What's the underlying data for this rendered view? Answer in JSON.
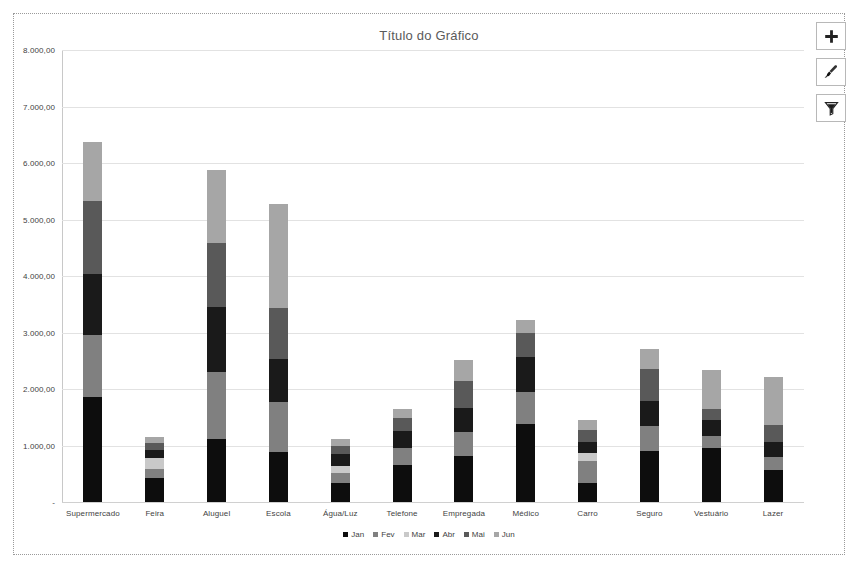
{
  "chart": {
    "title": "Título do Gráfico"
  },
  "buttons": [
    {
      "name": "chart-elements-button",
      "icon": "plus-icon",
      "tooltip": "Elementos do Gráfico"
    },
    {
      "name": "chart-styles-button",
      "icon": "paintbrush-icon",
      "tooltip": "Estilos de Gráfico"
    },
    {
      "name": "chart-filters-button",
      "icon": "funnel-icon",
      "tooltip": "Filtros de Gráfico"
    }
  ],
  "colors": {
    "jan": "#0d0d0d",
    "fev": "#808080",
    "mar": "#c9c9c9",
    "abr": "#1a1a1a",
    "mai": "#595959",
    "jun": "#a6a6a6",
    "gridline": "#e2e2e2",
    "axis": "#c8c8c8",
    "title": "#5a5a5a",
    "text": "#3f3f3f"
  },
  "chart_data": {
    "type": "bar",
    "stacked": true,
    "title": "Título do Gráfico",
    "xlabel": "",
    "ylabel": "",
    "ylim": [
      0,
      8000
    ],
    "grid": true,
    "legend_position": "bottom",
    "ytick_labels": [
      "-",
      "1.000,00",
      "2.000,00",
      "3.000,00",
      "4.000,00",
      "5.000,00",
      "6.000,00",
      "7.000,00",
      "8.000,00"
    ],
    "ytick_values": [
      0,
      1000,
      2000,
      3000,
      4000,
      5000,
      6000,
      7000,
      8000
    ],
    "categories": [
      "Supermercado",
      "Feira",
      "Aluguel",
      "Escola",
      "Água/Luz",
      "Telefone",
      "Empregada",
      "Médico",
      "Carro",
      "Seguro",
      "Vestuário",
      "Lazer"
    ],
    "series": [
      {
        "name": "Jan",
        "color": "#0d0d0d",
        "values": [
          1850,
          430,
          1120,
          890,
          340,
          650,
          820,
          1380,
          330,
          900,
          950,
          560
        ]
      },
      {
        "name": "Fev",
        "color": "#808080",
        "values": [
          1100,
          150,
          1190,
          880,
          170,
          310,
          420,
          560,
          390,
          450,
          210,
          230
        ]
      },
      {
        "name": "Mar",
        "color": "#c9c9c9",
        "values": [
          0,
          200,
          0,
          0,
          130,
          0,
          0,
          0,
          150,
          0,
          0,
          0
        ]
      },
      {
        "name": "Abr",
        "color": "#1a1a1a",
        "values": [
          1090,
          140,
          1150,
          760,
          210,
          300,
          430,
          620,
          190,
          430,
          300,
          280
        ]
      },
      {
        "name": "Mai",
        "color": "#595959",
        "values": [
          1280,
          120,
          1130,
          900,
          140,
          230,
          480,
          430,
          220,
          570,
          180,
          300
        ]
      },
      {
        "name": "Jun",
        "color": "#a6a6a6",
        "values": [
          1050,
          110,
          1290,
          1850,
          120,
          150,
          370,
          240,
          170,
          360,
          690,
          850
        ]
      }
    ],
    "totals": [
      6370,
      1150,
      5880,
      5280,
      1110,
      1640,
      2520,
      3230,
      1450,
      2710,
      2330,
      2220
    ]
  }
}
